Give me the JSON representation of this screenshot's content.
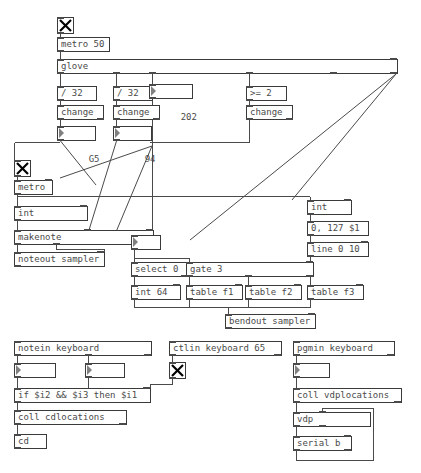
{
  "patch": {
    "title": "glove patch",
    "accent_color": "#4a4a4a",
    "background_color": "#ffffff",
    "toggles": [
      {
        "name": "metro-50-toggle",
        "state": "on",
        "glyph": "X"
      },
      {
        "name": "metro-toggle",
        "state": "on",
        "glyph": "X"
      },
      {
        "name": "ctlin-toggle",
        "state": "on",
        "glyph": "X"
      }
    ],
    "objects": {
      "metro_50": "metro 50",
      "glove": "glove",
      "div32_a": "/ 32",
      "div32_b": "/ 32",
      "gte2": ">= 2",
      "change_a": "change",
      "change_b": "change",
      "change_c": "change",
      "metro": "metro",
      "int_left": "int",
      "makenote": "makenote",
      "noteout": "noteout sampler",
      "select0": "select 0",
      "gate3": "gate 3",
      "int64": "int 64",
      "table_f1": "table f1",
      "table_f2": "table f2",
      "table_f3": "table f3",
      "bendout": "bendout sampler",
      "int_right": "int",
      "msg_0_127": "0, 127 $1",
      "line_0_10": "line 0 10",
      "notein": "notein keyboard",
      "ctlin": "ctlin keyboard 65",
      "pgmin": "pgmin keyboard",
      "expr_if": "if $i2 && $i3 then $i1",
      "coll_cdlocations": "coll cdlocations",
      "cd": "cd",
      "coll_vdplocations": "coll vdplocations",
      "vdp": "vdp",
      "serial_b": "serial b"
    },
    "numbers": {
      "num_202": "202",
      "num_g5": "G5",
      "num_94": "94",
      "num_3": "3",
      "num_fsharp4": "F#4",
      "num_106": "106",
      "num_33": "33"
    }
  }
}
